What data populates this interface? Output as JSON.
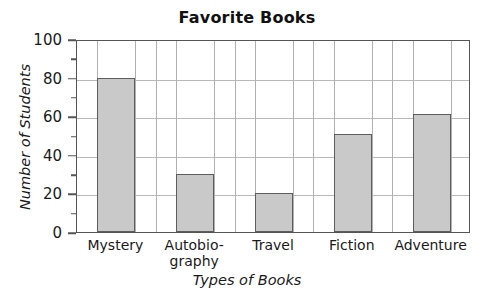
{
  "chart_data": {
    "type": "bar",
    "title": "Favorite Books",
    "xlabel": "Types of Books",
    "ylabel": "Number of Students",
    "categories": [
      "Mystery",
      "Autobio-\ngraphy",
      "Travel",
      "Fiction",
      "Adventure"
    ],
    "category_names": [
      "Mystery",
      "Autobiography",
      "Travel",
      "Fiction",
      "Adventure"
    ],
    "values": [
      80,
      30,
      20,
      51,
      61
    ],
    "ylim": [
      0,
      100
    ],
    "ytick_values": [
      0,
      20,
      40,
      60,
      80,
      100
    ],
    "ytick_labels": [
      "0",
      "20",
      "40",
      "60",
      "80",
      "100"
    ],
    "yminor_values": [
      10,
      30,
      50,
      70,
      90
    ],
    "grid": true,
    "grid_axis": "both",
    "legend": "none",
    "bar_fill": "#c9c9c9",
    "bar_edge": "#5d5d5d",
    "axis_color": "#555555",
    "grid_color": "#b3b3b3"
  }
}
